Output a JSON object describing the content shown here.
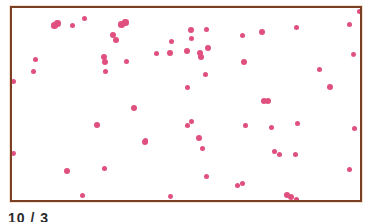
{
  "image": {
    "description": "Micrograph of pink-stained cocci scattered on a white field inside a brown frame",
    "frame_color": "#7a3f25",
    "dot_color": "#e0507e",
    "caption": "10 / 3"
  },
  "dots": [
    {
      "x": 55,
      "y": 26,
      "r": 3.2
    },
    {
      "x": 58,
      "y": 24,
      "r": 3.2
    },
    {
      "x": 73,
      "y": 26,
      "r": 2.6
    },
    {
      "x": 85,
      "y": 19,
      "r": 2.6
    },
    {
      "x": 122,
      "y": 25,
      "r": 3.2
    },
    {
      "x": 126,
      "y": 23,
      "r": 3.2
    },
    {
      "x": 113,
      "y": 35,
      "r": 3
    },
    {
      "x": 116,
      "y": 40,
      "r": 3
    },
    {
      "x": 104,
      "y": 57,
      "r": 3
    },
    {
      "x": 105,
      "y": 62,
      "r": 3
    },
    {
      "x": 106,
      "y": 72,
      "r": 2.8
    },
    {
      "x": 127,
      "y": 62,
      "r": 2.8
    },
    {
      "x": 36,
      "y": 60,
      "r": 2.6
    },
    {
      "x": 34,
      "y": 72,
      "r": 2.6
    },
    {
      "x": 14,
      "y": 82,
      "r": 2.8
    },
    {
      "x": 172,
      "y": 42,
      "r": 2.6
    },
    {
      "x": 170,
      "y": 53,
      "r": 3
    },
    {
      "x": 157,
      "y": 54,
      "r": 2.6
    },
    {
      "x": 191,
      "y": 30,
      "r": 3
    },
    {
      "x": 207,
      "y": 30,
      "r": 2.6
    },
    {
      "x": 192,
      "y": 39,
      "r": 2.6
    },
    {
      "x": 187,
      "y": 51,
      "r": 3
    },
    {
      "x": 200,
      "y": 53,
      "r": 3
    },
    {
      "x": 201,
      "y": 57,
      "r": 3
    },
    {
      "x": 208,
      "y": 48,
      "r": 3
    },
    {
      "x": 243,
      "y": 36,
      "r": 2.6
    },
    {
      "x": 262,
      "y": 32,
      "r": 3
    },
    {
      "x": 244,
      "y": 62,
      "r": 3
    },
    {
      "x": 297,
      "y": 28,
      "r": 2.6
    },
    {
      "x": 350,
      "y": 25,
      "r": 2.6
    },
    {
      "x": 360,
      "y": 12,
      "r": 2.6
    },
    {
      "x": 206,
      "y": 75,
      "r": 2.8
    },
    {
      "x": 188,
      "y": 88,
      "r": 2.8
    },
    {
      "x": 320,
      "y": 70,
      "r": 2.8
    },
    {
      "x": 330,
      "y": 87,
      "r": 3
    },
    {
      "x": 363,
      "y": 79,
      "r": 2.6
    },
    {
      "x": 264,
      "y": 101,
      "r": 3
    },
    {
      "x": 268,
      "y": 101,
      "r": 3
    },
    {
      "x": 97,
      "y": 125,
      "r": 3
    },
    {
      "x": 145,
      "y": 142,
      "r": 3
    },
    {
      "x": 134,
      "y": 108,
      "r": 3
    },
    {
      "x": 188,
      "y": 126,
      "r": 2.6
    },
    {
      "x": 192,
      "y": 122,
      "r": 2.6
    },
    {
      "x": 199,
      "y": 138,
      "r": 3
    },
    {
      "x": 203,
      "y": 149,
      "r": 2.6
    },
    {
      "x": 272,
      "y": 128,
      "r": 2.8
    },
    {
      "x": 298,
      "y": 124,
      "r": 2.6
    },
    {
      "x": 355,
      "y": 129,
      "r": 2.8
    },
    {
      "x": 246,
      "y": 126,
      "r": 2.2
    },
    {
      "x": 275,
      "y": 152,
      "r": 2.6
    },
    {
      "x": 280,
      "y": 155,
      "r": 2.6
    },
    {
      "x": 296,
      "y": 155,
      "r": 2.6
    },
    {
      "x": 14,
      "y": 154,
      "r": 2.4
    },
    {
      "x": 67,
      "y": 171,
      "r": 3
    },
    {
      "x": 105,
      "y": 169,
      "r": 2.6
    },
    {
      "x": 146,
      "y": 141,
      "r": 2.6
    },
    {
      "x": 207,
      "y": 177,
      "r": 2.6
    },
    {
      "x": 238,
      "y": 186,
      "r": 2.6
    },
    {
      "x": 243,
      "y": 184,
      "r": 2.6
    },
    {
      "x": 171,
      "y": 197,
      "r": 2.4
    },
    {
      "x": 83,
      "y": 196,
      "r": 2.6
    },
    {
      "x": 287,
      "y": 195,
      "r": 3
    },
    {
      "x": 291,
      "y": 197,
      "r": 3
    },
    {
      "x": 297,
      "y": 200,
      "r": 2.6
    },
    {
      "x": 350,
      "y": 170,
      "r": 2.8
    },
    {
      "x": 328,
      "y": 207,
      "r": 2.6
    },
    {
      "x": 336,
      "y": 207,
      "r": 3
    },
    {
      "x": 343,
      "y": 204,
      "r": 2.6
    },
    {
      "x": 354,
      "y": 55,
      "r": 2.4
    }
  ]
}
